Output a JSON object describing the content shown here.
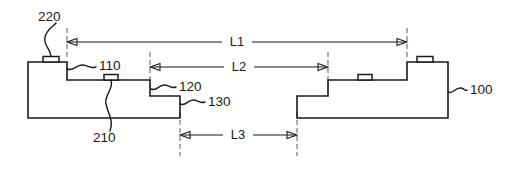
{
  "figure": {
    "background_color": "#ffffff",
    "line_color": "#1a1a1a",
    "witness_line_color": "#5a5a5a",
    "width": 509,
    "height": 169
  },
  "reference_numerals": [
    {
      "id": "220",
      "label": "220",
      "x": 40,
      "y": 17,
      "anchor": "start",
      "describes": "bump/pad on left top surface"
    },
    {
      "id": "110",
      "label": "110",
      "x": 100,
      "y": 66,
      "anchor": "start",
      "describes": "first step upper terrace"
    },
    {
      "id": "120",
      "label": "120",
      "x": 178,
      "y": 86,
      "anchor": "start",
      "describes": "second step terrace"
    },
    {
      "id": "130",
      "label": "130",
      "x": 207,
      "y": 101,
      "anchor": "start",
      "describes": "third step lower terrace"
    },
    {
      "id": "210",
      "label": "210",
      "x": 93,
      "y": 136,
      "anchor": "start",
      "describes": "pad on intermediate terrace"
    },
    {
      "id": "100",
      "label": "100",
      "x": 469,
      "y": 90,
      "anchor": "start",
      "describes": "substrate body"
    }
  ],
  "dimensions": [
    {
      "id": "L1",
      "label": "L1",
      "x1": 67,
      "x2": 407,
      "y": 42,
      "label_x": 237,
      "arrows": "both"
    },
    {
      "id": "L2",
      "label": "L2",
      "x1": 150,
      "x2": 328,
      "y": 67,
      "label_x": 239,
      "arrows": "both"
    },
    {
      "id": "L3",
      "label": "L3",
      "x1": 180,
      "x2": 297,
      "y": 135,
      "label_x": 238,
      "arrows": "both"
    }
  ],
  "witness_lines": [
    {
      "id": "w-L1-left",
      "x": 67,
      "y1": 28,
      "y2": 60
    },
    {
      "id": "w-L1-right",
      "x": 407,
      "y1": 28,
      "y2": 60
    },
    {
      "id": "w-L2-left",
      "x": 150,
      "y1": 52,
      "y2": 86
    },
    {
      "id": "w-L2-right",
      "x": 328,
      "y1": 52,
      "y2": 86
    },
    {
      "id": "w-L3-left",
      "x": 180,
      "y1": 110,
      "y2": 156
    },
    {
      "id": "w-L3-right",
      "x": 297,
      "y1": 110,
      "y2": 156
    }
  ],
  "shapes": {
    "left_body": {
      "name": "left-substrate-outline",
      "points": "28,62 67,62 67,80 150,80 150,96 180,96 180,118 28,118"
    },
    "right_body": {
      "name": "right-substrate-outline",
      "points": "297,118 297,96 328,96 328,80 407,80 407,62 448,62 448,118"
    }
  },
  "pads": [
    {
      "id": "pad-220",
      "name": "bump-pad-220",
      "x": 43,
      "y": 57,
      "w": 16,
      "h": 5
    },
    {
      "id": "pad-210",
      "name": "terrace-pad-210",
      "x": 104,
      "y": 75,
      "w": 14,
      "h": 5
    },
    {
      "id": "pad-right-lower",
      "name": "terrace-pad-right-lower",
      "x": 358,
      "y": 75,
      "w": 14,
      "h": 5
    },
    {
      "id": "pad-right-upper",
      "name": "bump-pad-right-upper",
      "x": 418,
      "y": 57,
      "w": 16,
      "h": 5
    }
  ],
  "leaders": [
    {
      "id": "leader-220",
      "name": "leader-line-220",
      "path": "M 51,56 C 50,48 44,44 46,36 C 48,28 53,27 56,23"
    },
    {
      "id": "leader-110",
      "name": "leader-line-110",
      "path": "M 67,68 C 74,70 76,63 83,64 C 90,65 91,68 96,67"
    },
    {
      "id": "leader-120",
      "name": "leader-line-120",
      "path": "M 152,88 C 158,90 160,83 166,84 C 172,85 172,88 176,87"
    },
    {
      "id": "leader-130",
      "name": "leader-line-130",
      "path": "M 181,103 C 187,105 189,98 195,99 C 201,100 201,103 205,102"
    },
    {
      "id": "leader-210",
      "name": "leader-line-210",
      "path": "M 111,80 C 113,89 105,93 107,103 C 109,113 114,120 110,131"
    },
    {
      "id": "leader-100",
      "name": "leader-line-100",
      "path": "M 448,91 C 452,93 455,86 461,87 C 466,88 466,91 467,90"
    }
  ]
}
